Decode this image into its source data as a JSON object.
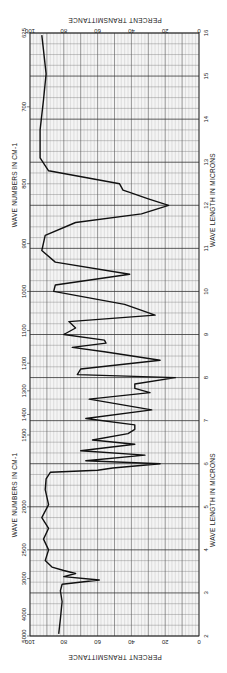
{
  "chart_data": {
    "type": "line",
    "title": "",
    "orientation": "rotated-90",
    "xlabel": "WAVE LENGTH IN MICRONS",
    "xlabel_secondary": "WAVE NUMBERS IN CM-1",
    "ylabel": "PERCENT TRANSMITTANCE",
    "xlim": [
      2,
      16
    ],
    "ylim": [
      0,
      100
    ],
    "grid": true,
    "micron_ticks": [
      "2",
      "3",
      "4",
      "5",
      "6",
      "7",
      "8",
      "9",
      "10",
      "11",
      "12",
      "13",
      "14",
      "15",
      "16"
    ],
    "wavenumber_ticks": [
      {
        "label": "5000",
        "value": 5000
      },
      {
        "label": "4000",
        "value": 4000
      },
      {
        "label": "3000",
        "value": 3000
      },
      {
        "label": "2500",
        "value": 2500
      },
      {
        "label": "2000",
        "value": 2000
      },
      {
        "label": "1500",
        "value": 1500
      },
      {
        "label": "1400",
        "value": 1400
      },
      {
        "label": "1300",
        "value": 1300
      },
      {
        "label": "1200",
        "value": 1200
      },
      {
        "label": "1100",
        "value": 1100
      },
      {
        "label": "1000",
        "value": 1000
      },
      {
        "label": "900",
        "value": 900
      },
      {
        "label": "800",
        "value": 800
      },
      {
        "label": "700",
        "value": 700
      },
      {
        "label": "625",
        "value": 625
      }
    ],
    "transmittance_ticks": [
      "100",
      "80",
      "60",
      "40",
      "20",
      "0"
    ],
    "series": [
      {
        "name": "spectrum",
        "x_microns": [
          2.05,
          2.4,
          2.8,
          3.05,
          3.2,
          3.3,
          3.38,
          3.45,
          3.52,
          3.6,
          3.75,
          4.0,
          4.25,
          4.5,
          4.75,
          5.05,
          5.4,
          5.65,
          5.8,
          5.85,
          5.9,
          6.0,
          6.07,
          6.2,
          6.3,
          6.45,
          6.55,
          6.7,
          6.8,
          6.9,
          7.05,
          7.25,
          7.5,
          7.65,
          7.75,
          7.85,
          8.0,
          8.07,
          8.2,
          8.4,
          8.6,
          8.7,
          8.8,
          8.87,
          9.0,
          9.15,
          9.3,
          9.45,
          9.7,
          10.0,
          10.15,
          10.4,
          10.68,
          10.95,
          11.3,
          11.6,
          11.8,
          12.0,
          12.15,
          12.3,
          12.35,
          12.5,
          12.8,
          13.1,
          13.75,
          14.45,
          15.05,
          15.6,
          15.95
        ],
        "y_percent": [
          83,
          82,
          81,
          82,
          81,
          59,
          80,
          73,
          80,
          87,
          91,
          89,
          92,
          89,
          93,
          89,
          91,
          90.5,
          88,
          60,
          51,
          23,
          67,
          32,
          70,
          38,
          63,
          42,
          38,
          38,
          67,
          28,
          65,
          29,
          38,
          38,
          14,
          72,
          70,
          23,
          56,
          75,
          55,
          56,
          80,
          73,
          77,
          26,
          44,
          86,
          85,
          41,
          85,
          93,
          91,
          73,
          34,
          18,
          30,
          41,
          45,
          47,
          89,
          94,
          94,
          92,
          90.5,
          92,
          93
        ]
      }
    ]
  }
}
